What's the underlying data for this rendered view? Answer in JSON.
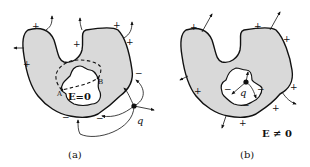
{
  "figure": {
    "panel_a": {
      "caption": "(a)",
      "field_label": "E=0",
      "point_a": "A",
      "point_b": "B",
      "charge_label": "q",
      "plus_sign": "+",
      "minus_sign": "−"
    },
    "panel_b": {
      "caption": "(b)",
      "field_label": "E ≠ 0",
      "charge_label": "q",
      "plus_sign": "+",
      "minus_sign": "−"
    }
  }
}
